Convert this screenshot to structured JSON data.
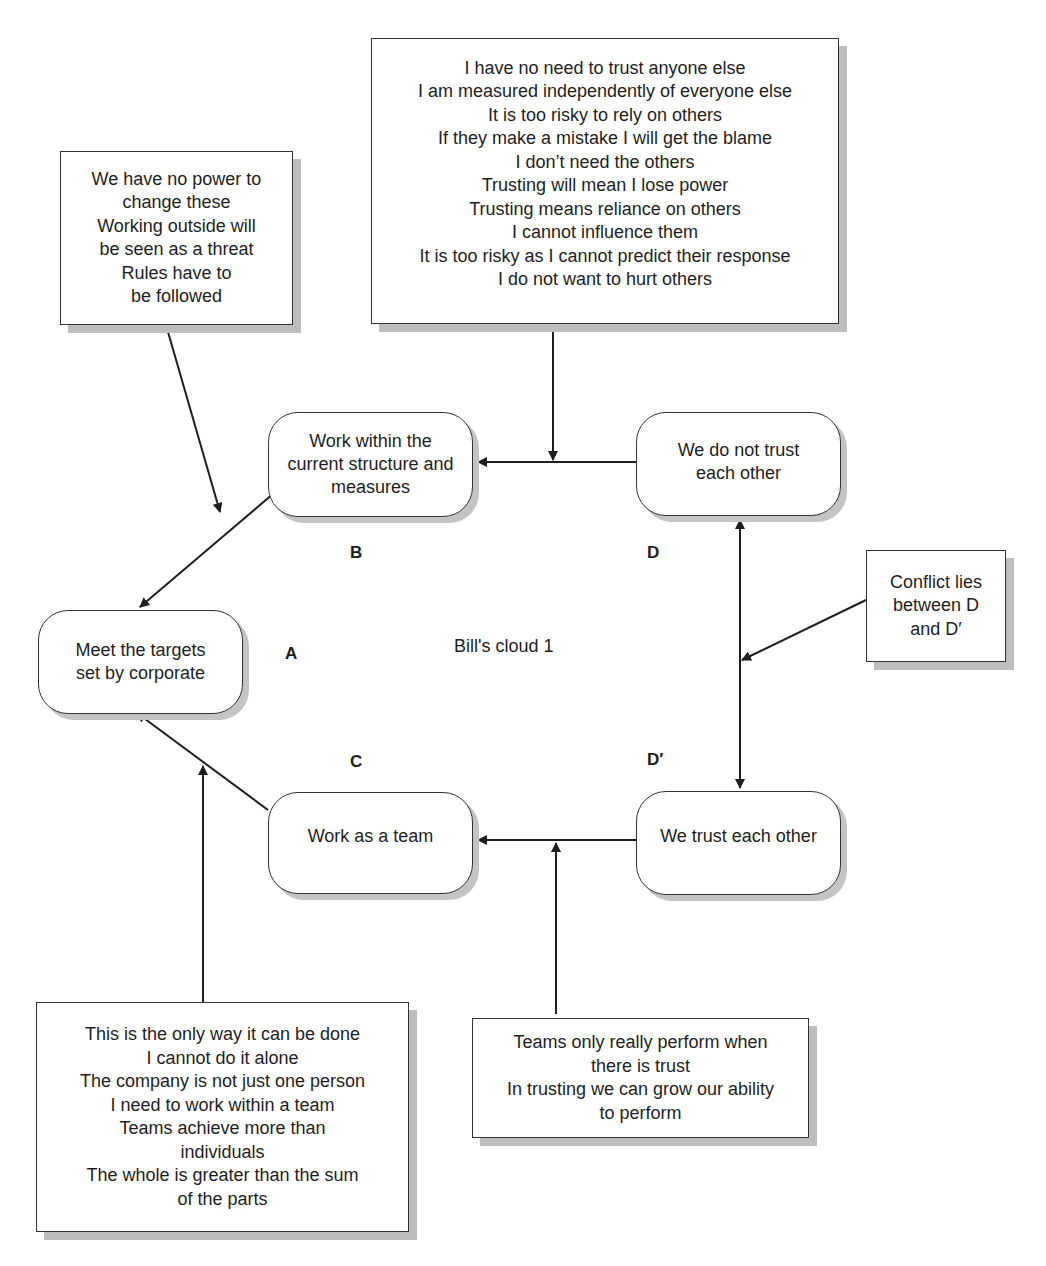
{
  "title": "Bill's cloud 1",
  "nodes": {
    "A": {
      "letter": "A",
      "text": [
        "Meet the targets",
        "set by corporate"
      ]
    },
    "B": {
      "letter": "B",
      "text": [
        "Work within the",
        "current structure and",
        "measures"
      ]
    },
    "C": {
      "letter": "C",
      "text": [
        "Work as a team"
      ]
    },
    "D": {
      "letter": "D",
      "text": [
        "We do not trust",
        "each other"
      ]
    },
    "D_prime": {
      "letter": "D′",
      "text": [
        "We trust each other"
      ]
    }
  },
  "assumptions": {
    "AB": [
      "We have no power to",
      "change these",
      "Working outside will",
      "be seen as a threat",
      "Rules have to",
      "be followed"
    ],
    "BD": [
      "I have no need to trust anyone else",
      "I am measured independently of everyone else",
      "It is too risky to rely on others",
      "If they make a mistake I will get the blame",
      "I don’t need the others",
      "Trusting will mean I lose power",
      "Trusting means reliance on others",
      "I cannot influence them",
      "It is too risky as I cannot predict their response",
      "I do not want to hurt others"
    ],
    "conflict": [
      "Conflict lies",
      "between D",
      "and D′"
    ],
    "AC": [
      "This is the only way it can be done",
      "I cannot do it alone",
      "The company is not just one person",
      "I need to work within a team",
      "Teams achieve more than",
      "individuals",
      "The whole is greater than the sum",
      "of the parts"
    ],
    "CD": [
      "Teams only really perform when",
      "there is trust",
      "In trusting we can grow our ability",
      "to perform"
    ]
  }
}
